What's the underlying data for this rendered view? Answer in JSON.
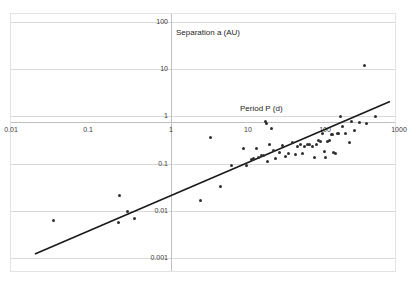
{
  "chart_data": {
    "type": "scatter",
    "title": "",
    "xlabel": "Period P (d)",
    "ylabel": "Separation a (AU)",
    "xscale": "log",
    "yscale": "log",
    "xlim": [
      0.01,
      1000
    ],
    "ylim": [
      0.001,
      100
    ],
    "grid": true,
    "legend": null,
    "xticks": [
      "0.01",
      "0.1",
      "1",
      "10",
      "100",
      "1000"
    ],
    "xtick_values": [
      0.01,
      0.1,
      1,
      10,
      100,
      1000
    ],
    "yticks": [
      "100",
      "10",
      "1",
      "0.1",
      "0.01",
      "0.001"
    ],
    "ytick_values": [
      100,
      10,
      1,
      0.1,
      0.01,
      0.001
    ],
    "axes_cross_at": {
      "x": 1,
      "y": 1
    },
    "marker": {
      "shape": "circle",
      "color": "#2f2f2f",
      "size_px": 3
    },
    "points": [
      {
        "x": 0.036,
        "y": 0.0063
      },
      {
        "x": 0.26,
        "y": 0.0215
      },
      {
        "x": 0.25,
        "y": 0.0057
      },
      {
        "x": 0.33,
        "y": 0.0099
      },
      {
        "x": 0.4,
        "y": 0.0068
      },
      {
        "x": 2.9,
        "y": 0.0165
      },
      {
        "x": 4.0,
        "y": 0.355
      },
      {
        "x": 5.3,
        "y": 0.0335
      },
      {
        "x": 7.4,
        "y": 0.093
      },
      {
        "x": 10.5,
        "y": 0.205
      },
      {
        "x": 11.5,
        "y": 0.092
      },
      {
        "x": 13.5,
        "y": 0.124
      },
      {
        "x": 14.5,
        "y": 0.131
      },
      {
        "x": 15.5,
        "y": 0.205
      },
      {
        "x": 16.5,
        "y": 0.132
      },
      {
        "x": 18.0,
        "y": 0.148
      },
      {
        "x": 19.5,
        "y": 0.147
      },
      {
        "x": 20.5,
        "y": 0.78
      },
      {
        "x": 21.5,
        "y": 0.7
      },
      {
        "x": 22.0,
        "y": 0.112
      },
      {
        "x": 23.5,
        "y": 0.255
      },
      {
        "x": 25.0,
        "y": 0.56
      },
      {
        "x": 26.0,
        "y": 0.187
      },
      {
        "x": 28.0,
        "y": 0.129
      },
      {
        "x": 31.0,
        "y": 0.175
      },
      {
        "x": 34.0,
        "y": 0.245
      },
      {
        "x": 37.0,
        "y": 0.142
      },
      {
        "x": 41.0,
        "y": 0.163
      },
      {
        "x": 46.0,
        "y": 0.285
      },
      {
        "x": 50.0,
        "y": 0.154
      },
      {
        "x": 54.0,
        "y": 0.225
      },
      {
        "x": 58.0,
        "y": 0.252
      },
      {
        "x": 62.0,
        "y": 0.165
      },
      {
        "x": 66.0,
        "y": 0.225
      },
      {
        "x": 72.0,
        "y": 0.252
      },
      {
        "x": 78.0,
        "y": 0.253
      },
      {
        "x": 84.0,
        "y": 0.232
      },
      {
        "x": 90.0,
        "y": 0.136
      },
      {
        "x": 96.0,
        "y": 0.255
      },
      {
        "x": 102.0,
        "y": 0.305
      },
      {
        "x": 108.0,
        "y": 0.296
      },
      {
        "x": 115.0,
        "y": 0.425
      },
      {
        "x": 120.0,
        "y": 0.182
      },
      {
        "x": 126.0,
        "y": 0.133
      },
      {
        "x": 132.0,
        "y": 0.296
      },
      {
        "x": 140.0,
        "y": 0.305
      },
      {
        "x": 148.0,
        "y": 0.412
      },
      {
        "x": 152.0,
        "y": 0.413
      },
      {
        "x": 160.0,
        "y": 0.172
      },
      {
        "x": 168.0,
        "y": 0.163
      },
      {
        "x": 176.0,
        "y": 0.428
      },
      {
        "x": 186.0,
        "y": 0.432
      },
      {
        "x": 196.0,
        "y": 0.98
      },
      {
        "x": 205.0,
        "y": 0.605
      },
      {
        "x": 230.0,
        "y": 0.435
      },
      {
        "x": 255.0,
        "y": 0.275
      },
      {
        "x": 275.0,
        "y": 0.775
      },
      {
        "x": 300.0,
        "y": 0.5
      },
      {
        "x": 340.0,
        "y": 0.73
      },
      {
        "x": 400.0,
        "y": 11.8
      },
      {
        "x": 430.0,
        "y": 0.7
      },
      {
        "x": 560.0,
        "y": 1.0
      }
    ],
    "trendline": {
      "label": "",
      "color": "#1a1a1a",
      "x_start": 0.0205,
      "y_start": 0.00122,
      "x_end": 860.0,
      "y_end": 2.06
    }
  }
}
